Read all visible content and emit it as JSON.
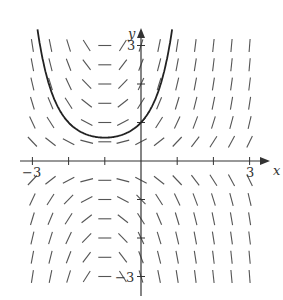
{
  "figure": {
    "type": "slope_field",
    "equation_inferred": "dy/dx = y(x+1)",
    "axis_labels": {
      "x": "x",
      "y": "y"
    },
    "tick_labels": {
      "x_min": "−3",
      "x_max": "3",
      "y_max": "3",
      "y_min": "−3"
    },
    "x_range": [
      -3,
      3
    ],
    "y_range": [
      -3,
      3
    ],
    "x_ticks": [
      -3,
      -2,
      -1,
      0,
      1,
      2,
      3
    ],
    "y_ticks": [
      -3,
      -2,
      -1,
      0,
      1,
      2,
      3
    ],
    "field_x": [
      -3,
      -2.5,
      -2,
      -1.5,
      -1,
      -0.5,
      0,
      0.5,
      1,
      1.5,
      2,
      2.5,
      3
    ],
    "field_y": [
      -3,
      -2.5,
      -2,
      -1.5,
      -1,
      -0.5,
      0.5,
      1,
      1.5,
      2,
      2.5,
      3
    ],
    "solution_curve": {
      "description": "y = e^(x^2/2 + x), through (0,1), minimum near (-1, 0.61)",
      "color": "#222222"
    },
    "colors": {
      "axis": "#333333",
      "segments": "#555555",
      "curve": "#222222"
    }
  }
}
